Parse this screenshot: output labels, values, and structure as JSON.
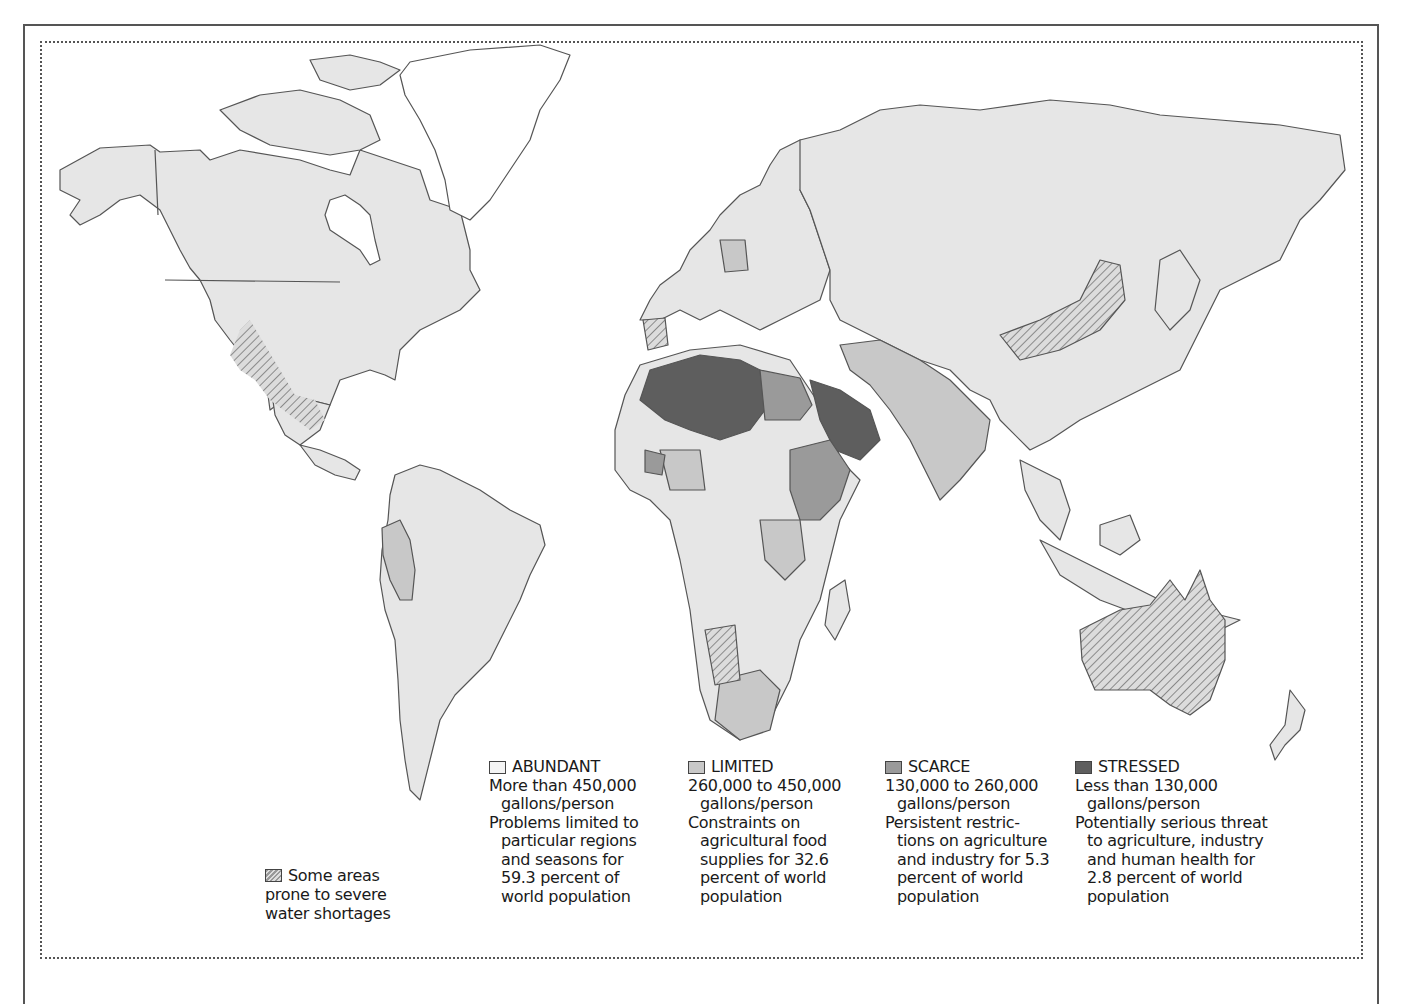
{
  "map": {
    "title_visible": false,
    "subject": "World freshwater availability per person",
    "colors": {
      "abundant": "#e6e6e6",
      "limited": "#c8c8c8",
      "scarce": "#9a9a9a",
      "stressed": "#5e5e5e",
      "border": "#555555",
      "hatch": "#8a8a8a"
    }
  },
  "legend": {
    "hatch": {
      "lines": [
        "Some areas",
        "prone to severe",
        "water shortages"
      ]
    },
    "categories": [
      {
        "label": "ABUNDANT",
        "range": "More than 450,000",
        "unit": "gallons/person",
        "desc": [
          "Problems limited to",
          "particular regions",
          "and seasons for",
          "59.3 percent of",
          "world population"
        ],
        "color": "#f4f4f4"
      },
      {
        "label": "LIMITED",
        "range": "260,000 to 450,000",
        "unit": "gallons/person",
        "desc": [
          "Constraints on",
          "agricultural food",
          "supplies for 32.6",
          "percent of world",
          "population"
        ],
        "color": "#c8c8c8"
      },
      {
        "label": "SCARCE",
        "range": "130,000 to 260,000",
        "unit": "gallons/person",
        "desc": [
          "Persistent restric-",
          "tions on agriculture",
          "and industry for 5.3",
          "percent of world",
          "population"
        ],
        "color": "#9a9a9a"
      },
      {
        "label": "STRESSED",
        "range": "Less than 130,000",
        "unit": "gallons/person",
        "desc": [
          "Potentially serious threat",
          "to agriculture, industry",
          "and human health for",
          "2.8 percent of world",
          "population"
        ],
        "color": "#5e5e5e"
      }
    ]
  }
}
